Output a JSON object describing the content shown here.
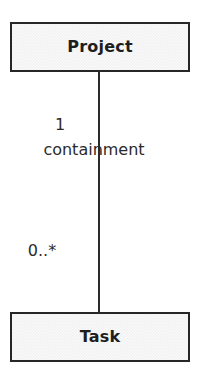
{
  "diagram": {
    "type": "uml-class-diagram",
    "canvas": {
      "width": 202,
      "height": 382
    },
    "background_color": "#ffffff",
    "classes": [
      {
        "id": "project",
        "name": "Project",
        "fill_color": "#f1f1f1",
        "border_color": "#262626"
      },
      {
        "id": "task",
        "name": "Task",
        "fill_color": "#f1f1f1",
        "border_color": "#262626"
      }
    ],
    "association": {
      "name": "containment",
      "source_multiplicity": "1",
      "target_multiplicity": "0..*",
      "line_color": "#2b2b2b"
    }
  }
}
